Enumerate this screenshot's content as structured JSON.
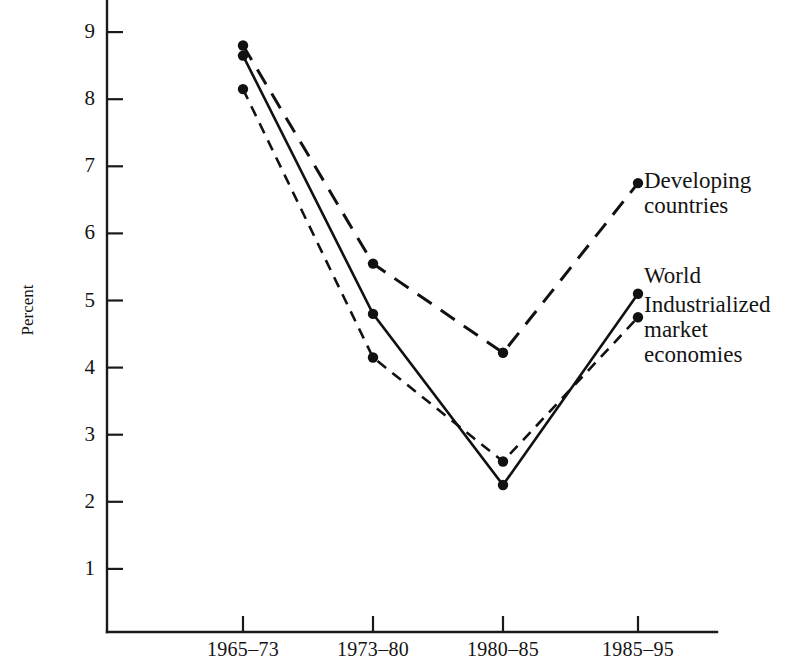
{
  "chart_data": {
    "type": "line",
    "title": "",
    "xlabel": "",
    "ylabel": "Percent",
    "categories": [
      "1965–73",
      "1973–80",
      "1980–85",
      "1985–95"
    ],
    "ylim": [
      0,
      9.4
    ],
    "yticks": [
      1,
      2,
      3,
      4,
      5,
      6,
      7,
      8,
      9
    ],
    "ytick_labels": [
      "1",
      "2",
      "3",
      "4",
      "5",
      "6",
      "7",
      "8",
      "9"
    ],
    "grid": false,
    "legend_position": "right-inline",
    "series": [
      {
        "name": "Developing countries",
        "style": "dashed-long",
        "marker": "filled-circle",
        "values": [
          8.8,
          5.55,
          4.22,
          6.75
        ]
      },
      {
        "name": "World",
        "style": "solid",
        "marker": "filled-circle",
        "values": [
          8.65,
          4.8,
          2.25,
          5.1
        ]
      },
      {
        "name": "Industrialized market economies",
        "style": "dashed-short",
        "marker": "filled-circle",
        "values": [
          8.15,
          4.15,
          2.6,
          4.75
        ]
      }
    ]
  },
  "axis": {
    "y_label": "Percent",
    "y_tick_labels": [
      "9",
      "8",
      "7",
      "6",
      "5",
      "4",
      "3",
      "2",
      "1"
    ],
    "x_tick_labels": [
      "1965–73",
      "1973–80",
      "1980–85",
      "1985–95"
    ]
  },
  "labels": {
    "developing": "Developing\ncountries",
    "world": "World",
    "industrialized": "Industrialized\nmarket\neconomies"
  },
  "colors": {
    "ink": "#111111",
    "background": "#ffffff"
  }
}
